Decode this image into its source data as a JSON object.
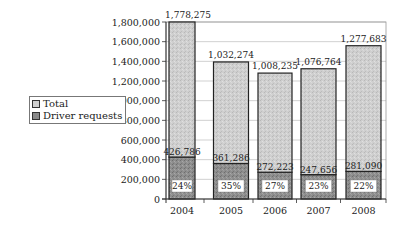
{
  "chart_data": {
    "type": "bar",
    "stacked": true,
    "title": "",
    "xlabel": "",
    "ylabel": "",
    "categories": [
      "2004",
      "2005",
      "2006",
      "2007",
      "2008"
    ],
    "series": [
      {
        "name": "Driver requests",
        "values": [
          426786,
          361286,
          272223,
          247656,
          281090
        ],
        "color": "#8a8a8a"
      },
      {
        "name": "Total",
        "values": [
          1778275,
          1032274,
          1008235,
          1076764,
          1277683
        ],
        "color": "#c8c8c8"
      }
    ],
    "percent_labels": [
      "24%",
      "35%",
      "27%",
      "23%",
      "22%"
    ],
    "value_labels": {
      "total": [
        "1,778,275",
        "1,032,274",
        "1,008,235",
        "1,076,764",
        "1,277,683"
      ],
      "driver_requests": [
        "426,786",
        "361,286",
        "272,223",
        "247,656",
        "281,090"
      ]
    },
    "ylim": [
      0,
      1800000
    ],
    "yticks": [
      0,
      200000,
      400000,
      600000,
      800000,
      1000000,
      1200000,
      1400000,
      1600000,
      1800000
    ],
    "ytick_labels": [
      "0",
      "200,000",
      "400,000",
      "600,000",
      "800,000",
      "1,000,000",
      "1,200,000",
      "1,400,000",
      "1,600,000",
      "1,800,000"
    ],
    "grid": true,
    "legend_position": "left"
  },
  "legend": {
    "items": [
      {
        "label": "Total",
        "color": "#c8c8c8"
      },
      {
        "label": "Driver requests",
        "color": "#8a8a8a"
      }
    ]
  }
}
